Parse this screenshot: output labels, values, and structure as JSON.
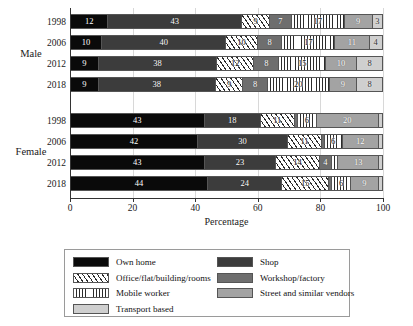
{
  "chart_data": {
    "type": "bar",
    "orientation": "horizontal",
    "stacked": true,
    "title": "",
    "xlabel": "Percentage",
    "ylabel": "",
    "xlim": [
      0,
      100
    ],
    "xticks": [
      0,
      20,
      40,
      60,
      80,
      100
    ],
    "grid": true,
    "legend_position": "bottom",
    "group_labels": [
      "Male",
      "Female"
    ],
    "categories": [
      "1998",
      "2006",
      "2012",
      "2018"
    ],
    "series": [
      {
        "name": "Own home",
        "color": "#0a0a0a",
        "pattern": "solid",
        "values_male": [
          12,
          10,
          9,
          9
        ],
        "values_female": [
          43,
          42,
          43,
          44
        ]
      },
      {
        "name": "Shop",
        "color": "#3c3c3c",
        "pattern": "solid",
        "values_male": [
          43,
          40,
          38,
          38
        ],
        "values_female": [
          18,
          30,
          23,
          24
        ]
      },
      {
        "name": "Office/flat/building/rooms",
        "color": "#2b2b2b",
        "pattern": "diagonal-hatch",
        "values_male": [
          9,
          10,
          12,
          9
        ],
        "values_female": [
          11,
          11,
          14,
          15
        ]
      },
      {
        "name": "Workshop/factory",
        "color": "#6e6e6e",
        "pattern": "solid",
        "values_male": [
          7,
          8,
          8,
          8
        ],
        "values_female": [
          1,
          1,
          4,
          1
        ]
      },
      {
        "name": "Mobile worker",
        "color": "#2b2b2b",
        "pattern": "vertical-lines",
        "values_male": [
          17,
          17,
          15,
          20
        ],
        "values_female": [
          6,
          6,
          2,
          6
        ]
      },
      {
        "name": "Street and similar vendors",
        "color": "#a3a3a3",
        "pattern": "solid",
        "values_male": [
          9,
          11,
          10,
          9
        ],
        "values_female": [
          20,
          12,
          13,
          9
        ]
      },
      {
        "name": "Transport based",
        "color": "#cfcfcf",
        "pattern": "solid",
        "values_male": [
          3,
          4,
          8,
          8
        ],
        "values_female": [
          1,
          1,
          1,
          1
        ]
      }
    ],
    "bars": [
      {
        "group": "Male",
        "year": "1998",
        "segments": [
          {
            "key": "own",
            "label": "Own home",
            "value": 12,
            "show_label": true
          },
          {
            "key": "shop",
            "label": "Shop",
            "value": 43,
            "show_label": true
          },
          {
            "key": "office",
            "label": "Office/flat/building/rooms",
            "value": 9,
            "show_label": true
          },
          {
            "key": "workshop",
            "label": "Workshop/factory",
            "value": 7,
            "show_label": true
          },
          {
            "key": "mobile",
            "label": "Mobile worker",
            "value": 17,
            "show_label": true
          },
          {
            "key": "street",
            "label": "Street and similar vendors",
            "value": 9,
            "show_label": true
          },
          {
            "key": "transport",
            "label": "Transport based",
            "value": 3,
            "show_label": true
          }
        ]
      },
      {
        "group": "Male",
        "year": "2006",
        "segments": [
          {
            "key": "own",
            "label": "Own home",
            "value": 10,
            "show_label": true
          },
          {
            "key": "shop",
            "label": "Shop",
            "value": 40,
            "show_label": true
          },
          {
            "key": "office",
            "label": "Office/flat/building/rooms",
            "value": 10,
            "show_label": true
          },
          {
            "key": "workshop",
            "label": "Workshop/factory",
            "value": 8,
            "show_label": true
          },
          {
            "key": "mobile",
            "label": "Mobile worker",
            "value": 17,
            "show_label": true
          },
          {
            "key": "street",
            "label": "Street and similar vendors",
            "value": 11,
            "show_label": true
          },
          {
            "key": "transport",
            "label": "Transport based",
            "value": 4,
            "show_label": true
          }
        ]
      },
      {
        "group": "Male",
        "year": "2012",
        "segments": [
          {
            "key": "own",
            "label": "Own home",
            "value": 9,
            "show_label": true
          },
          {
            "key": "shop",
            "label": "Shop",
            "value": 38,
            "show_label": true
          },
          {
            "key": "office",
            "label": "Office/flat/building/rooms",
            "value": 12,
            "show_label": true
          },
          {
            "key": "workshop",
            "label": "Workshop/factory",
            "value": 8,
            "show_label": true
          },
          {
            "key": "mobile",
            "label": "Mobile worker",
            "value": 15,
            "show_label": true
          },
          {
            "key": "street",
            "label": "Street and similar vendors",
            "value": 10,
            "show_label": true
          },
          {
            "key": "transport",
            "label": "Transport based",
            "value": 8,
            "show_label": true
          }
        ]
      },
      {
        "group": "Male",
        "year": "2018",
        "segments": [
          {
            "key": "own",
            "label": "Own home",
            "value": 9,
            "show_label": true
          },
          {
            "key": "shop",
            "label": "Shop",
            "value": 38,
            "show_label": true
          },
          {
            "key": "office",
            "label": "Office/flat/building/rooms",
            "value": 9,
            "show_label": true
          },
          {
            "key": "workshop",
            "label": "Workshop/factory",
            "value": 8,
            "show_label": true
          },
          {
            "key": "mobile",
            "label": "Mobile worker",
            "value": 20,
            "show_label": true
          },
          {
            "key": "street",
            "label": "Street and similar vendors",
            "value": 9,
            "show_label": true
          },
          {
            "key": "transport",
            "label": "Transport based",
            "value": 8,
            "show_label": true
          }
        ]
      },
      {
        "group": "Female",
        "year": "1998",
        "segments": [
          {
            "key": "own",
            "label": "Own home",
            "value": 43,
            "show_label": true
          },
          {
            "key": "shop",
            "label": "Shop",
            "value": 18,
            "show_label": true
          },
          {
            "key": "office",
            "label": "Office/flat/building/rooms",
            "value": 11,
            "show_label": true
          },
          {
            "key": "workshop",
            "label": "Workshop/factory",
            "value": 1,
            "show_label": false
          },
          {
            "key": "mobile",
            "label": "Mobile worker",
            "value": 6,
            "show_label": true
          },
          {
            "key": "street",
            "label": "Street and similar vendors",
            "value": 20,
            "show_label": true
          },
          {
            "key": "transport",
            "label": "Transport based",
            "value": 1,
            "show_label": false
          }
        ]
      },
      {
        "group": "Female",
        "year": "2006",
        "segments": [
          {
            "key": "own",
            "label": "Own home",
            "value": 42,
            "show_label": true
          },
          {
            "key": "shop",
            "label": "Shop",
            "value": 30,
            "show_label": true
          },
          {
            "key": "office",
            "label": "Office/flat/building/rooms",
            "value": 11,
            "show_label": true
          },
          {
            "key": "workshop",
            "label": "Workshop/factory",
            "value": 1,
            "show_label": false
          },
          {
            "key": "mobile",
            "label": "Mobile worker",
            "value": 6,
            "show_label": true
          },
          {
            "key": "street",
            "label": "Street and similar vendors",
            "value": 12,
            "show_label": true
          },
          {
            "key": "transport",
            "label": "Transport based",
            "value": 1,
            "show_label": false
          }
        ]
      },
      {
        "group": "Female",
        "year": "2012",
        "segments": [
          {
            "key": "own",
            "label": "Own home",
            "value": 43,
            "show_label": true
          },
          {
            "key": "shop",
            "label": "Shop",
            "value": 23,
            "show_label": true
          },
          {
            "key": "office",
            "label": "Office/flat/building/rooms",
            "value": 14,
            "show_label": true
          },
          {
            "key": "workshop",
            "label": "Workshop/factory",
            "value": 4,
            "show_label": true
          },
          {
            "key": "mobile",
            "label": "Mobile worker",
            "value": 2,
            "show_label": false
          },
          {
            "key": "street",
            "label": "Street and similar vendors",
            "value": 13,
            "show_label": true
          },
          {
            "key": "transport",
            "label": "Transport based",
            "value": 1,
            "show_label": false
          }
        ]
      },
      {
        "group": "Female",
        "year": "2018",
        "segments": [
          {
            "key": "own",
            "label": "Own home",
            "value": 44,
            "show_label": true
          },
          {
            "key": "shop",
            "label": "Shop",
            "value": 24,
            "show_label": true
          },
          {
            "key": "office",
            "label": "Office/flat/building/rooms",
            "value": 15,
            "show_label": true
          },
          {
            "key": "workshop",
            "label": "Workshop/factory",
            "value": 1,
            "show_label": false
          },
          {
            "key": "mobile",
            "label": "Mobile worker",
            "value": 6,
            "show_label": true
          },
          {
            "key": "street",
            "label": "Street and similar vendors",
            "value": 9,
            "show_label": true
          },
          {
            "key": "transport",
            "label": "Transport based",
            "value": 1,
            "show_label": false
          }
        ]
      }
    ],
    "legend": {
      "column_left": [
        {
          "key": "own",
          "label": "Own home"
        },
        {
          "key": "office",
          "label": "Office/flat/building/rooms"
        },
        {
          "key": "mobile",
          "label": "Mobile worker"
        },
        {
          "key": "transport",
          "label": "Transport based"
        }
      ],
      "column_right": [
        {
          "key": "shop",
          "label": "Shop"
        },
        {
          "key": "workshop",
          "label": "Workshop/factory"
        },
        {
          "key": "street",
          "label": "Street and similar vendors"
        }
      ]
    },
    "colors": {
      "own": "#0a0a0a",
      "shop": "#3c3c3c",
      "office": "#2b2b2b",
      "workshop": "#6e6e6e",
      "mobile": "#2b2b2b",
      "street": "#a3a3a3",
      "transport": "#cfcfcf"
    }
  }
}
